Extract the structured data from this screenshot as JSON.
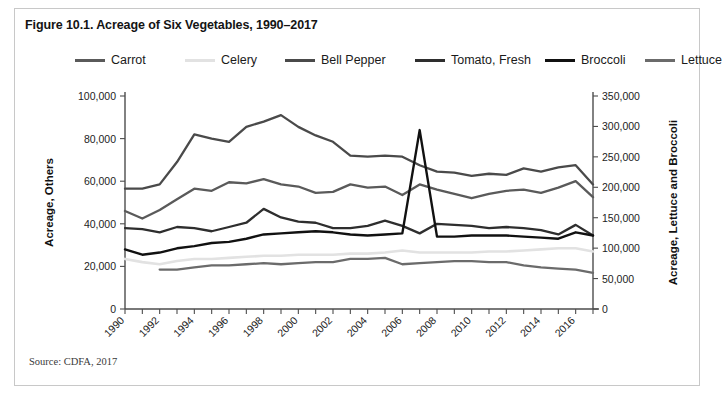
{
  "figure": {
    "title": "Figure 10.1. Acreage of Six Vegetables, 1990–2017",
    "source": "Source: CDFA, 2017"
  },
  "colors": {
    "carrot": "#5a5a5a",
    "celery": "#e2e2e2",
    "bell_pepper": "#4a4a4a",
    "tomato_fresh": "#2e2e2e",
    "broccoli": "#111111",
    "lettuce": "#6b6b6b",
    "axis": "#4d4d4d",
    "frame": "#c8c8c8",
    "text": "#141414"
  },
  "chart_data": {
    "type": "line",
    "title": "Figure 10.1. Acreage of Six Vegetables, 1990–2017",
    "xlabel": "",
    "ylabel": "Acreage, Others",
    "y2label": "Acreage, Lettuce and Broccoli",
    "ylim": [
      0,
      100000
    ],
    "y2lim": [
      0,
      350000
    ],
    "yticks": [
      "0",
      "20,000",
      "40,000",
      "60,000",
      "80,000",
      "100,000"
    ],
    "ytick_values": [
      0,
      20000,
      40000,
      60000,
      80000,
      100000
    ],
    "y2ticks": [
      "0",
      "50,000",
      "100,000",
      "150,000",
      "200,000",
      "250,000",
      "300,000",
      "350,000"
    ],
    "y2tick_values": [
      0,
      50000,
      100000,
      150000,
      200000,
      250000,
      300000,
      350000
    ],
    "grid": false,
    "legend_position": "top",
    "x": [
      1990,
      1991,
      1992,
      1993,
      1994,
      1995,
      1996,
      1997,
      1998,
      1999,
      2000,
      2001,
      2002,
      2003,
      2004,
      2005,
      2006,
      2007,
      2008,
      2009,
      2010,
      2011,
      2012,
      2013,
      2014,
      2015,
      2016,
      2017
    ],
    "xtick_labels": [
      "1990",
      "1992",
      "1994",
      "1996",
      "1998",
      "2000",
      "2002",
      "2004",
      "2006",
      "2008",
      "2010",
      "2012",
      "2014",
      "2016"
    ],
    "xtick_values": [
      1990,
      1992,
      1994,
      1996,
      1998,
      2000,
      2002,
      2004,
      2006,
      2008,
      2010,
      2012,
      2014,
      2016
    ],
    "series": [
      {
        "name": "Carrot",
        "axis": "left",
        "color": "#5a5a5a",
        "values": [
          46000,
          42500,
          46500,
          51500,
          56500,
          55500,
          59500,
          59000,
          61000,
          58500,
          57500,
          54500,
          55000,
          58500,
          57000,
          57500,
          53500,
          58500,
          56000,
          54000,
          52000,
          54000,
          55500,
          56000,
          54500,
          57000,
          60000,
          52500
        ]
      },
      {
        "name": "Celery",
        "axis": "left",
        "color": "#e2e2e2",
        "values": [
          23500,
          22000,
          21000,
          22500,
          23500,
          23500,
          24000,
          24500,
          25000,
          25000,
          25500,
          25500,
          25500,
          26000,
          26000,
          26500,
          27500,
          26500,
          26500,
          26500,
          26500,
          27000,
          27000,
          27500,
          28000,
          28500,
          28500,
          27000
        ]
      },
      {
        "name": "Bell Pepper",
        "axis": "left",
        "color": "#4a4a4a",
        "values": [
          56500,
          56500,
          58500,
          69000,
          82000,
          80000,
          78500,
          85500,
          88000,
          91000,
          85500,
          81500,
          78500,
          72000,
          71500,
          72000,
          71500,
          67500,
          64500,
          64000,
          62500,
          63500,
          63000,
          66000,
          64500,
          66500,
          67500,
          58500
        ]
      },
      {
        "name": "Tomato, Fresh",
        "axis": "left",
        "color": "#2e2e2e",
        "values": [
          38000,
          37500,
          36000,
          38500,
          38000,
          36500,
          38500,
          40500,
          47000,
          43000,
          41000,
          40500,
          38000,
          38000,
          39000,
          41500,
          39000,
          35500,
          40000,
          39500,
          39000,
          38000,
          38500,
          38000,
          37000,
          35000,
          39500,
          34500
        ]
      },
      {
        "name": "Broccoli",
        "axis": "left",
        "color": "#111111",
        "values": [
          28000,
          25500,
          26500,
          28500,
          29500,
          31000,
          31500,
          33000,
          35000,
          35500,
          36000,
          36500,
          36000,
          35000,
          34500,
          35000,
          35500,
          84000,
          34000,
          34000,
          34500,
          34500,
          34500,
          34000,
          33500,
          33000,
          36000,
          34500
        ]
      },
      {
        "name": "Lettuce",
        "axis": "left",
        "color": "#6b6b6b",
        "values": [
          null,
          null,
          18500,
          18500,
          19500,
          20500,
          20500,
          21000,
          21500,
          21000,
          21500,
          22000,
          22000,
          23500,
          23500,
          24000,
          21000,
          21500,
          22000,
          22500,
          22500,
          22000,
          22000,
          20500,
          19500,
          19000,
          18500,
          17000
        ]
      }
    ]
  },
  "legend": {
    "items": [
      {
        "label": "Carrot",
        "color": "#5a5a5a",
        "x": 30
      },
      {
        "label": "Celery",
        "color": "#e2e2e2",
        "x": 140
      },
      {
        "label": "Bell Pepper",
        "color": "#4a4a4a",
        "x": 240
      },
      {
        "label": "Tomato, Fresh",
        "color": "#2e2e2e",
        "x": 370
      },
      {
        "label": "Broccoli",
        "color": "#111111",
        "x": 500
      },
      {
        "label": "Lettuce",
        "color": "#6b6b6b",
        "x": 600
      }
    ]
  }
}
